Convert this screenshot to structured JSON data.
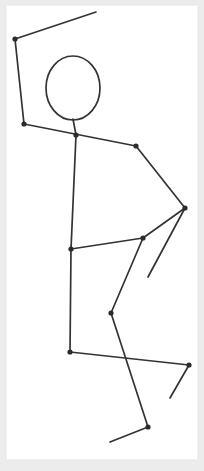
{
  "artwork": {
    "title": "Stick Figure Pose Sketch",
    "canvas_width": 204,
    "canvas_height": 471,
    "background_color": "#ffffff",
    "mat_color": "#ececed",
    "card": {
      "x": 6,
      "y": 5,
      "width": 192,
      "height": 455,
      "border_color": "#f2f2f2"
    },
    "stroke_color": "#333333",
    "joint_color": "#2b2b2b",
    "stroke_width": 1.7,
    "joint_radius": 2.6
  },
  "chart_data": {
    "type": "scatter",
    "xlabel": "",
    "ylabel": "",
    "xlim": [
      0,
      204
    ],
    "ylim": [
      471,
      0
    ],
    "grid": false,
    "legend": "none",
    "head": {
      "cx": 73,
      "cy": 88,
      "rx": 27,
      "ry": 32
    },
    "joints": [
      {
        "name": "left-hand",
        "x": 15,
        "y": 39
      },
      {
        "name": "left-shoulder",
        "x": 24,
        "y": 124
      },
      {
        "name": "neck-base",
        "x": 76,
        "y": 135
      },
      {
        "name": "right-shoulder",
        "x": 136,
        "y": 146
      },
      {
        "name": "right-elbow",
        "x": 185,
        "y": 208
      },
      {
        "name": "upper-hip",
        "x": 143,
        "y": 238
      },
      {
        "name": "hip",
        "x": 71,
        "y": 249
      },
      {
        "name": "knee",
        "x": 111,
        "y": 313
      },
      {
        "name": "pelvis-low",
        "x": 70,
        "y": 352
      },
      {
        "name": "right-knee",
        "x": 189,
        "y": 365
      },
      {
        "name": "ankle",
        "x": 148,
        "y": 427
      }
    ],
    "endpoints": [
      {
        "name": "left-fingertip",
        "x": 96,
        "y": 12
      },
      {
        "name": "head-top-neck",
        "x": 73,
        "y": 119
      },
      {
        "name": "right-hand",
        "x": 148,
        "y": 277
      },
      {
        "name": "right-foot-tip",
        "x": 170,
        "y": 398
      },
      {
        "name": "left-foot-tip",
        "x": 110,
        "y": 442
      }
    ],
    "segments": [
      {
        "name": "left-forearm",
        "from": [
          96,
          12
        ],
        "to": [
          15,
          39
        ]
      },
      {
        "name": "left-upper-arm",
        "from": [
          15,
          39
        ],
        "to": [
          24,
          124
        ]
      },
      {
        "name": "left-clavicle",
        "from": [
          24,
          124
        ],
        "to": [
          136,
          146
        ]
      },
      {
        "name": "neck",
        "from": [
          73,
          119
        ],
        "to": [
          76,
          135
        ]
      },
      {
        "name": "torso",
        "from": [
          76,
          135
        ],
        "to": [
          71,
          249
        ]
      },
      {
        "name": "right-upper-arm",
        "from": [
          136,
          146
        ],
        "to": [
          185,
          208
        ]
      },
      {
        "name": "right-forearm",
        "from": [
          185,
          208
        ],
        "to": [
          148,
          277
        ]
      },
      {
        "name": "right-flank",
        "from": [
          185,
          208
        ],
        "to": [
          143,
          238
        ]
      },
      {
        "name": "hip-link",
        "from": [
          143,
          238
        ],
        "to": [
          71,
          249
        ]
      },
      {
        "name": "upper-thigh",
        "from": [
          143,
          238
        ],
        "to": [
          111,
          313
        ]
      },
      {
        "name": "left-thigh",
        "from": [
          71,
          249
        ],
        "to": [
          70,
          352
        ]
      },
      {
        "name": "shin",
        "from": [
          111,
          313
        ],
        "to": [
          148,
          427
        ]
      },
      {
        "name": "pelvis-span",
        "from": [
          70,
          352
        ],
        "to": [
          189,
          365
        ]
      },
      {
        "name": "right-shin",
        "from": [
          189,
          365
        ],
        "to": [
          170,
          398
        ]
      },
      {
        "name": "left-foot",
        "from": [
          148,
          427
        ],
        "to": [
          110,
          442
        ]
      }
    ]
  }
}
